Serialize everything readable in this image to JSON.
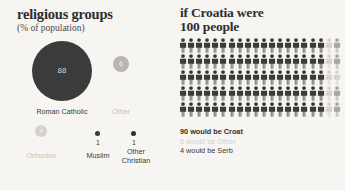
{
  "colors": {
    "background": "#f7f5f1",
    "dark": "#3b3b3b",
    "mid_gray": "#b9b6b1",
    "light_gray": "#d6d3ce",
    "text": "#3a3a3a"
  },
  "left_panel": {
    "title": "religious groups",
    "subtitle": "(% of population)",
    "labels": {
      "roman_catholic": "Roman Catholic",
      "other": "Other",
      "orthodox": "Orthodox",
      "muslim": "Muslim",
      "other_christian": "Other\nChristian",
      "other_christian_line1": "Other",
      "other_christian_line2": "Christian"
    },
    "values": {
      "roman_catholic": "88",
      "other": "6",
      "orthodox": "4",
      "muslim": "1",
      "other_christian": "1"
    }
  },
  "right_panel": {
    "title_line1": "if Croatia were",
    "title_line2": "100 people",
    "legend": {
      "croat": "90 would be Croat",
      "other": "6 would be Other",
      "serb": "4 would be Serb"
    }
  },
  "chart_data": [
    {
      "type": "bubble",
      "title": "religious groups",
      "subtitle": "(% of population)",
      "unit": "% of population",
      "categories": [
        "Roman Catholic",
        "Other",
        "Orthodox",
        "Muslim",
        "Other Christian"
      ],
      "values": [
        88,
        6,
        4,
        1,
        1
      ],
      "colors": [
        "#3b3b3b",
        "#b9b6b1",
        "#d6d3ce",
        "#3b3b3b",
        "#2f2f2f"
      ],
      "labels_shown": [
        true,
        true,
        true,
        true,
        true
      ],
      "legend": "none",
      "grid": false
    },
    {
      "type": "pictogram",
      "title": "if Croatia were 100 people",
      "total": 100,
      "rows": 5,
      "columns": 20,
      "icon": "person-icon",
      "categories": [
        "Croat",
        "Other",
        "Serb"
      ],
      "values": [
        90,
        6,
        4
      ],
      "colors": [
        "#3b3b3b",
        "#d6d3ce",
        "#a9a6a1"
      ],
      "annotations": [
        "90 would be Croat",
        "6 would be Other",
        "4 would be Serb"
      ],
      "legend": "below",
      "grid": false
    }
  ]
}
